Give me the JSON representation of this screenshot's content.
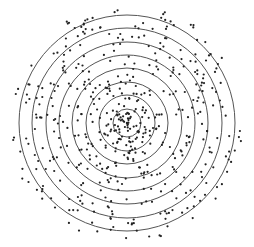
{
  "diagram": {
    "type": "concentric-rings-scatter",
    "center": [
      127,
      123
    ],
    "ring_radii": [
      14,
      28,
      41,
      55,
      68,
      81,
      95,
      108
    ],
    "ring_color": "#555555",
    "dot_color": "#222222",
    "dot_radius": 1.1,
    "background": "#ffffff"
  },
  "chart_data": {
    "type": "scatter",
    "title": "",
    "xlabel": "",
    "ylabel": "",
    "ring_count": 8,
    "points_approx": 520,
    "seed": 7
  }
}
